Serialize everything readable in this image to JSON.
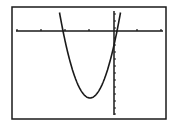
{
  "graph": {
    "type": "graphing-calculator-screen",
    "curve": "parabola opening upward",
    "colors": {
      "background": "#ffffff",
      "frame": "#1a1a1a",
      "axes": "#1a1a1a",
      "curve": "#1a1a1a"
    },
    "frame": {
      "x": 12,
      "y": 7,
      "w": 154,
      "h": 112
    },
    "x_axis_y": 31,
    "y_axis_x": 114,
    "x_ticks": [
      17,
      41,
      65,
      89,
      137,
      161
    ],
    "y_ticks": [
      14,
      21,
      28,
      38,
      45,
      52,
      59,
      66,
      73,
      80,
      87,
      94,
      101,
      108,
      114
    ],
    "vertex_px": [
      90,
      98
    ],
    "left_root_px": 63,
    "right_root_px": 117
  }
}
